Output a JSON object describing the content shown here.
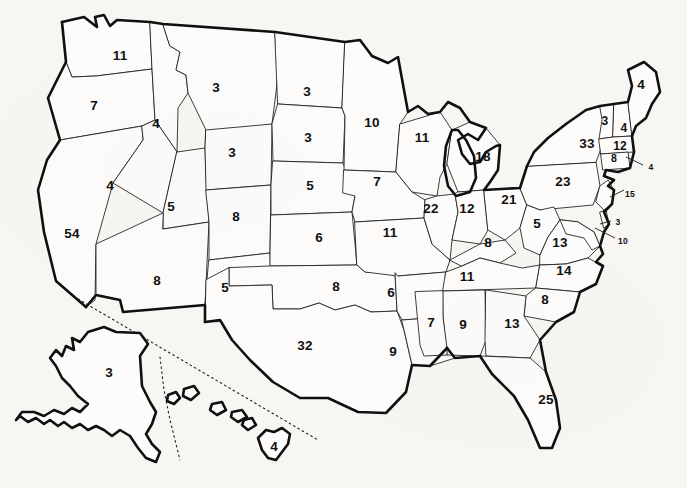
{
  "page": {
    "background_color": "#f7f6f3",
    "ink_color": "#111111",
    "state_fill": "#fdfcfa"
  },
  "chart_data": {
    "type": "map",
    "subtitle": "",
    "value_label": "Electoral votes",
    "total_value": 538,
    "grid": false,
    "legend": null,
    "regions": [
      {
        "code": "WA",
        "name": "Washington",
        "value": 11,
        "x": 120,
        "y": 56,
        "size": "lg",
        "leader": false
      },
      {
        "code": "OR",
        "name": "Oregon",
        "value": 7,
        "x": 94,
        "y": 106,
        "size": "lg",
        "leader": false
      },
      {
        "code": "CA",
        "name": "California",
        "value": 54,
        "x": 72,
        "y": 234,
        "size": "lg",
        "leader": false
      },
      {
        "code": "ID",
        "name": "Idaho",
        "value": 4,
        "x": 156,
        "y": 124,
        "size": "lg",
        "leader": false
      },
      {
        "code": "NV",
        "name": "Nevada",
        "value": 4,
        "x": 110,
        "y": 186,
        "size": "lg",
        "leader": false
      },
      {
        "code": "UT",
        "name": "Utah",
        "value": 5,
        "x": 171,
        "y": 207,
        "size": "lg",
        "leader": false
      },
      {
        "code": "AZ",
        "name": "Arizona",
        "value": 8,
        "x": 157,
        "y": 281,
        "size": "lg",
        "leader": false
      },
      {
        "code": "MT",
        "name": "Montana",
        "value": 3,
        "x": 216,
        "y": 88,
        "size": "lg",
        "leader": false
      },
      {
        "code": "WY",
        "name": "Wyoming",
        "value": 3,
        "x": 232,
        "y": 153,
        "size": "lg",
        "leader": false
      },
      {
        "code": "CO",
        "name": "Colorado",
        "value": 8,
        "x": 236,
        "y": 217,
        "size": "lg",
        "leader": false
      },
      {
        "code": "NM",
        "name": "New Mexico",
        "value": 5,
        "x": 225,
        "y": 288,
        "size": "lg",
        "leader": false
      },
      {
        "code": "ND",
        "name": "North Dakota",
        "value": 3,
        "x": 307,
        "y": 92,
        "size": "lg",
        "leader": false
      },
      {
        "code": "SD",
        "name": "South Dakota",
        "value": 3,
        "x": 308,
        "y": 138,
        "size": "lg",
        "leader": false
      },
      {
        "code": "NE",
        "name": "Nebraska",
        "value": 5,
        "x": 310,
        "y": 186,
        "size": "lg",
        "leader": false
      },
      {
        "code": "KS",
        "name": "Kansas",
        "value": 6,
        "x": 319,
        "y": 238,
        "size": "lg",
        "leader": false
      },
      {
        "code": "OK",
        "name": "Oklahoma",
        "value": 8,
        "x": 336,
        "y": 287,
        "size": "lg",
        "leader": false
      },
      {
        "code": "TX",
        "name": "Texas",
        "value": 32,
        "x": 305,
        "y": 346,
        "size": "lg",
        "leader": false
      },
      {
        "code": "MN",
        "name": "Minnesota",
        "value": 10,
        "x": 372,
        "y": 123,
        "size": "lg",
        "leader": false
      },
      {
        "code": "IA",
        "name": "Iowa",
        "value": 7,
        "x": 377,
        "y": 182,
        "size": "lg",
        "leader": false
      },
      {
        "code": "MO",
        "name": "Missouri",
        "value": 11,
        "x": 390,
        "y": 233,
        "size": "lg",
        "leader": false
      },
      {
        "code": "AR",
        "name": "Arkansas",
        "value": 6,
        "x": 391,
        "y": 293,
        "size": "lg",
        "leader": false
      },
      {
        "code": "LA",
        "name": "Louisiana",
        "value": 9,
        "x": 393,
        "y": 352,
        "size": "lg",
        "leader": false
      },
      {
        "code": "WI",
        "name": "Wisconsin",
        "value": 11,
        "x": 422,
        "y": 138,
        "size": "lg",
        "leader": false
      },
      {
        "code": "IL",
        "name": "Illinois",
        "value": 22,
        "x": 431,
        "y": 209,
        "size": "lg",
        "leader": false
      },
      {
        "code": "MS",
        "name": "Mississippi",
        "value": 7,
        "x": 431,
        "y": 323,
        "size": "lg",
        "leader": false
      },
      {
        "code": "MI",
        "name": "Michigan",
        "value": 18,
        "x": 483,
        "y": 157,
        "size": "lg",
        "leader": false
      },
      {
        "code": "IN",
        "name": "Indiana",
        "value": 12,
        "x": 467,
        "y": 209,
        "size": "lg",
        "leader": false
      },
      {
        "code": "KY",
        "name": "Kentucky",
        "value": 8,
        "x": 488,
        "y": 243,
        "size": "lg",
        "leader": false
      },
      {
        "code": "TN",
        "name": "Tennessee",
        "value": 11,
        "x": 467,
        "y": 277,
        "size": "lg",
        "leader": false
      },
      {
        "code": "AL",
        "name": "Alabama",
        "value": 9,
        "x": 463,
        "y": 325,
        "size": "lg",
        "leader": false
      },
      {
        "code": "OH",
        "name": "Ohio",
        "value": 21,
        "x": 509,
        "y": 200,
        "size": "lg",
        "leader": false
      },
      {
        "code": "WV",
        "name": "West Virginia",
        "value": 5,
        "x": 537,
        "y": 224,
        "size": "lg",
        "leader": false
      },
      {
        "code": "VA",
        "name": "Virginia",
        "value": 13,
        "x": 560,
        "y": 243,
        "size": "lg",
        "leader": false
      },
      {
        "code": "NC",
        "name": "North Carolina",
        "value": 14,
        "x": 564,
        "y": 271,
        "size": "lg",
        "leader": false
      },
      {
        "code": "SC",
        "name": "South Carolina",
        "value": 8,
        "x": 545,
        "y": 300,
        "size": "lg",
        "leader": false
      },
      {
        "code": "GA",
        "name": "Georgia",
        "value": 13,
        "x": 512,
        "y": 324,
        "size": "lg",
        "leader": false
      },
      {
        "code": "FL",
        "name": "Florida",
        "value": 25,
        "x": 546,
        "y": 400,
        "size": "lg",
        "leader": false
      },
      {
        "code": "PA",
        "name": "Pennsylvania",
        "value": 23,
        "x": 563,
        "y": 182,
        "size": "lg",
        "leader": false
      },
      {
        "code": "NY",
        "name": "New York",
        "value": 33,
        "x": 587,
        "y": 144,
        "size": "lg",
        "leader": false
      },
      {
        "code": "VT",
        "name": "Vermont",
        "value": 3,
        "x": 605,
        "y": 121,
        "size": "md",
        "leader": false
      },
      {
        "code": "NH",
        "name": "New Hampshire",
        "value": 4,
        "x": 624,
        "y": 128,
        "size": "md",
        "leader": false
      },
      {
        "code": "ME",
        "name": "Maine",
        "value": 4,
        "x": 641,
        "y": 85,
        "size": "lg",
        "leader": false
      },
      {
        "code": "MA",
        "name": "Massachusetts",
        "value": 12,
        "x": 620,
        "y": 146,
        "size": "md",
        "leader": false
      },
      {
        "code": "CT",
        "name": "Connecticut",
        "value": 8,
        "x": 614,
        "y": 158,
        "size": "sm",
        "leader": false
      },
      {
        "code": "RI",
        "name": "Rhode Island",
        "value": 4,
        "x": 651,
        "y": 167,
        "size": "xs",
        "leader": true
      },
      {
        "code": "NJ",
        "name": "New Jersey",
        "value": 15,
        "x": 630,
        "y": 194,
        "size": "xs",
        "leader": true
      },
      {
        "code": "DE",
        "name": "Delaware",
        "value": 3,
        "x": 618,
        "y": 222,
        "size": "xs",
        "leader": true
      },
      {
        "code": "MD",
        "name": "Maryland",
        "value": 10,
        "x": 623,
        "y": 241,
        "size": "xs",
        "leader": true
      },
      {
        "code": "AK",
        "name": "Alaska",
        "value": 3,
        "x": 109,
        "y": 373,
        "size": "lg",
        "leader": false
      },
      {
        "code": "HI",
        "name": "Hawaii",
        "value": 4,
        "x": 274,
        "y": 447,
        "size": "lg",
        "leader": false
      }
    ]
  }
}
